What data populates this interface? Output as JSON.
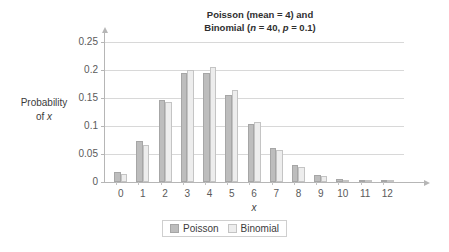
{
  "chart_data": {
    "type": "bar",
    "title": "Poisson (mean = 4) and Binomial (n = 40, p = 0.1)",
    "title_line1": "Poisson (mean = 4) and",
    "title_line2_pre": "Binomial (",
    "title_line2_n": "n",
    "title_line2_mid": " = 40, ",
    "title_line2_p": "p",
    "title_line2_post": " = 0.1)",
    "xlabel": "x",
    "ylabel": "Probability of x",
    "ylabel_line1": "Probability",
    "ylabel_line2_pre": "of ",
    "ylabel_line2_var": "x",
    "categories": [
      "0",
      "1",
      "2",
      "3",
      "4",
      "5",
      "6",
      "7",
      "8",
      "9",
      "10",
      "11",
      "12"
    ],
    "ylim": [
      0,
      0.25
    ],
    "ytick_labels": [
      "0",
      "0.05",
      "0.1",
      "0.15",
      "0.2",
      "0.25"
    ],
    "ytick_values": [
      0,
      0.05,
      0.1,
      0.15,
      0.2,
      0.25
    ],
    "grid": true,
    "legend_position": "bottom-center",
    "series": [
      {
        "name": "Poisson",
        "color": "#bdbdbd",
        "values": [
          0.018,
          0.073,
          0.147,
          0.195,
          0.195,
          0.156,
          0.104,
          0.06,
          0.03,
          0.013,
          0.005,
          0.002,
          0.001
        ]
      },
      {
        "name": "Binomial",
        "color": "#ededed",
        "values": [
          0.0148,
          0.0657,
          0.1423,
          0.2003,
          0.2059,
          0.1647,
          0.1068,
          0.0576,
          0.0264,
          0.0104,
          0.0036,
          0.0011,
          0.0003
        ]
      }
    ]
  },
  "legend": {
    "items": [
      {
        "label": "Poisson"
      },
      {
        "label": "Binomial"
      }
    ]
  }
}
